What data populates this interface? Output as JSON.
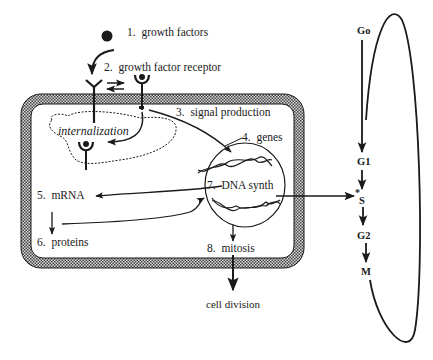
{
  "diagram": {
    "steps": [
      {
        "num": "1.",
        "label": "growth factors"
      },
      {
        "num": "2.",
        "label": "growth factor receptor"
      },
      {
        "num": "3.",
        "label": "signal production"
      },
      {
        "num": "4.",
        "label": "genes"
      },
      {
        "num": "5.",
        "label": "mRNA"
      },
      {
        "num": "6.",
        "label": "proteins"
      },
      {
        "num": "7.",
        "label": "DNA synth"
      },
      {
        "num": "8.",
        "label": "mitosis"
      }
    ],
    "internalization_label": "internalization",
    "outcome_label": "cell division",
    "cell_cycle": {
      "phases": [
        "Go",
        "G1",
        "S",
        "G2",
        "M"
      ],
      "s_marker": "*"
    },
    "colors": {
      "line": "#1a1a1a",
      "membrane_fill": "#9a9a9a",
      "background": "#ffffff"
    }
  }
}
